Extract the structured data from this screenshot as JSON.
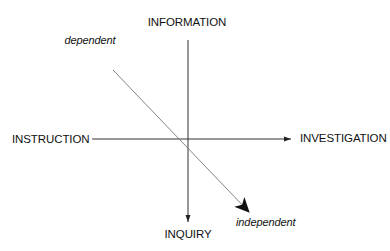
{
  "diagram": {
    "axes": {
      "top": "INFORMATION",
      "bottom": "INQUIRY",
      "left": "INSTRUCTION",
      "right": "INVESTIGATION"
    },
    "diagonal": {
      "start": "dependent",
      "end": "independent"
    },
    "colors": {
      "line": "#222222",
      "background": "#ffffff"
    }
  }
}
